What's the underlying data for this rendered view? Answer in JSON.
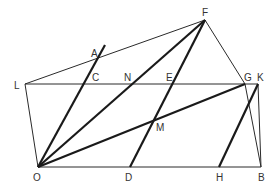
{
  "diagram": {
    "type": "geometric-construction",
    "points": {
      "F": {
        "label": "F",
        "x": 205,
        "y": 20
      },
      "A": {
        "label": "A",
        "x": 105,
        "y": 45
      },
      "L": {
        "label": "L",
        "x": 25,
        "y": 84
      },
      "C": {
        "label": "C",
        "x": 87,
        "y": 84
      },
      "N": {
        "label": "N",
        "x": 140,
        "y": 84
      },
      "E": {
        "label": "E",
        "x": 173,
        "y": 84
      },
      "G": {
        "label": "G",
        "x": 245,
        "y": 84
      },
      "K": {
        "label": "K",
        "x": 258,
        "y": 84
      },
      "M": {
        "label": "M",
        "x": 153,
        "y": 121
      },
      "O": {
        "label": "O",
        "x": 38,
        "y": 167
      },
      "D": {
        "label": "D",
        "x": 130,
        "y": 167
      },
      "H": {
        "label": "H",
        "x": 219,
        "y": 167
      },
      "B": {
        "label": "B",
        "x": 261,
        "y": 167
      }
    },
    "thin_segments": [
      [
        "L",
        "F"
      ],
      [
        "L",
        "K"
      ],
      [
        "L",
        "O"
      ],
      [
        "O",
        "B"
      ],
      [
        "F",
        "G"
      ],
      [
        "G",
        "B"
      ],
      [
        "K",
        "B"
      ]
    ],
    "thick_segments": [
      [
        "O",
        "A"
      ],
      [
        "O",
        "F"
      ],
      [
        "O",
        "G"
      ],
      [
        "D",
        "F"
      ],
      [
        "H",
        "K"
      ]
    ]
  }
}
